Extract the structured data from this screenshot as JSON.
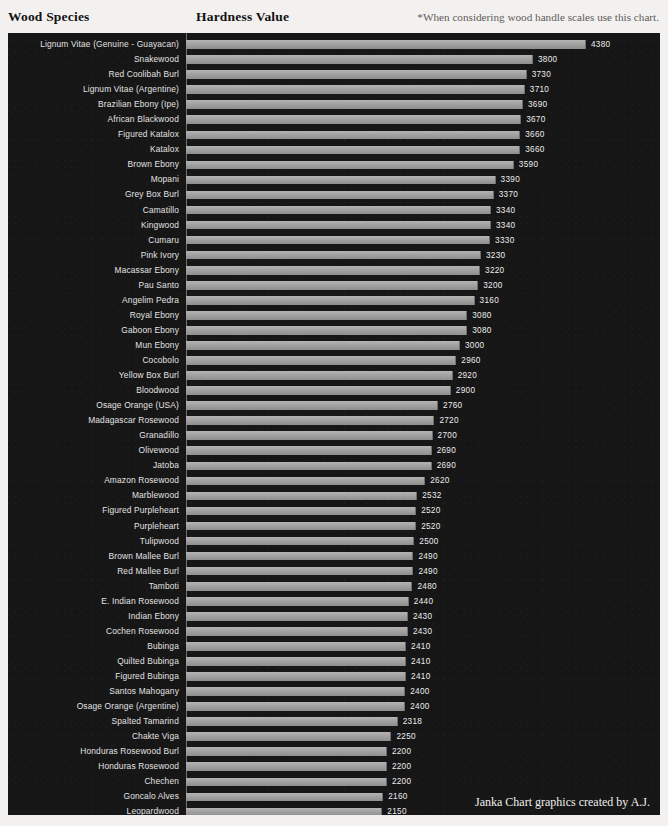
{
  "header": {
    "species_label": "Wood Species",
    "hardness_label": "Hardness Value",
    "note": "*When considering wood handle scales use this chart."
  },
  "credit": "Janka Chart graphics created by A.J.",
  "chart_data": {
    "type": "bar",
    "orientation": "horizontal",
    "title": "",
    "xlabel": "Hardness Value",
    "ylabel": "Wood Species",
    "grid": false,
    "legend": "none",
    "xlim": [
      0,
      4380
    ],
    "categories": [
      "Lignum Vitae (Genuine - Guayacan)",
      "Snakewood",
      "Red Coolibah Burl",
      "Lignum Vitae (Argentine)",
      "Brazilian Ebony (Ipe)",
      "African Blackwood",
      "Figured Katalox",
      "Katalox",
      "Brown Ebony",
      "Mopani",
      "Grey Box Burl",
      "Camatillo",
      "Kingwood",
      "Cumaru",
      "Pink Ivory",
      "Macassar Ebony",
      "Pau Santo",
      "Angelim Pedra",
      "Royal Ebony",
      "Gaboon Ebony",
      "Mun Ebony",
      "Cocobolo",
      "Yellow Box Burl",
      "Bloodwood",
      "Osage Orange (USA)",
      "Madagascar Rosewood",
      "Granadillo",
      "Olivewood",
      "Jatoba",
      "Amazon Rosewood",
      "Marblewood",
      "Figured Purpleheart",
      "Purpleheart",
      "Tulipwood",
      "Brown Mallee Burl",
      "Red Mallee Burl",
      "Tamboti",
      "E. Indian Rosewood",
      "Indian Ebony",
      "Cochen Rosewood",
      "Bubinga",
      "Quilted Bubinga",
      "Figured Bubinga",
      "Santos Mahogany",
      "Osage Orange (Argentine)",
      "Spalted Tamarind",
      "Chakte Viga",
      "Honduras Rosewood Burl",
      "Honduras Rosewood",
      "Chechen",
      "Goncalo Alves",
      "Leopardwood",
      "Sucupira",
      "Black Palm"
    ],
    "values": [
      4380,
      3800,
      3730,
      3710,
      3690,
      3670,
      3660,
      3660,
      3590,
      3390,
      3370,
      3340,
      3340,
      3330,
      3230,
      3220,
      3200,
      3160,
      3080,
      3080,
      3000,
      2960,
      2920,
      2900,
      2760,
      2720,
      2700,
      2690,
      2690,
      2620,
      2532,
      2520,
      2520,
      2500,
      2490,
      2490,
      2480,
      2440,
      2430,
      2430,
      2410,
      2410,
      2410,
      2400,
      2400,
      2318,
      2250,
      2200,
      2200,
      2200,
      2160,
      2150,
      2140,
      2020
    ],
    "bar_color": "#a2a2a2",
    "background_color": "#161616",
    "label_color": "#e3e3e3"
  }
}
